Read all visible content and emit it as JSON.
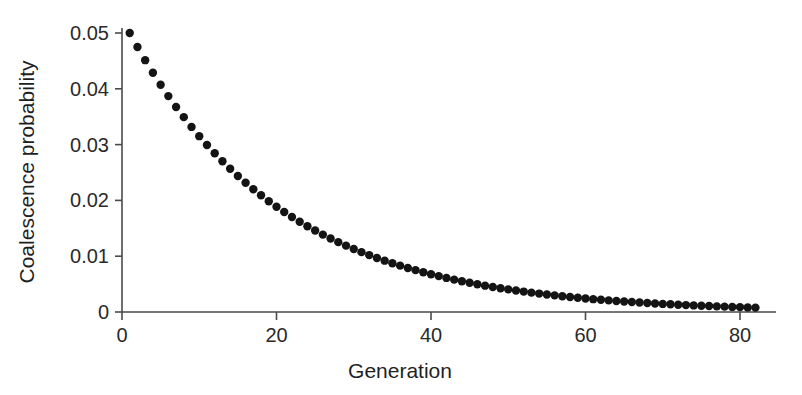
{
  "figure": {
    "background_color": "#ffffff",
    "point_color": "#141414",
    "axis_color": "#4a4a4a"
  },
  "chart_data": {
    "type": "scatter",
    "title": "",
    "subtitle": "",
    "xlabel": "Generation",
    "ylabel": "Coalescence probability",
    "xlim": [
      0,
      84
    ],
    "ylim": [
      0,
      0.052
    ],
    "xticks": [
      0,
      20,
      40,
      60,
      80
    ],
    "xticklabels": [
      "0",
      "20",
      "40",
      "60",
      "80"
    ],
    "yticks": [
      0,
      0.01,
      0.02,
      0.03,
      0.04,
      0.05
    ],
    "yticklabels": [
      "0",
      "0.01",
      "0.02",
      "0.03",
      "0.04",
      "0.05"
    ],
    "grid": false,
    "legend": null,
    "annotations": [],
    "marker": "circle",
    "marker_size": 4.2,
    "series": [
      {
        "name": "Coalescence probability",
        "x": [
          1,
          2,
          3,
          4,
          5,
          6,
          7,
          8,
          9,
          10,
          11,
          12,
          13,
          14,
          15,
          16,
          17,
          18,
          19,
          20,
          21,
          22,
          23,
          24,
          25,
          26,
          27,
          28,
          29,
          30,
          31,
          32,
          33,
          34,
          35,
          36,
          37,
          38,
          39,
          40,
          41,
          42,
          43,
          44,
          45,
          46,
          47,
          48,
          49,
          50,
          51,
          52,
          53,
          54,
          55,
          56,
          57,
          58,
          59,
          60,
          61,
          62,
          63,
          64,
          65,
          66,
          67,
          68,
          69,
          70,
          71,
          72,
          73,
          74,
          75,
          76,
          77,
          78,
          79,
          80,
          81,
          82
        ],
        "y": [
          0.05,
          0.0475,
          0.04513,
          0.04287,
          0.04073,
          0.03869,
          0.03675,
          0.03492,
          0.03317,
          0.03151,
          0.02994,
          0.02844,
          0.02702,
          0.02567,
          0.02438,
          0.02316,
          0.02201,
          0.02091,
          0.01986,
          0.01887,
          0.01792,
          0.01703,
          0.01618,
          0.01537,
          0.0146,
          0.01387,
          0.01318,
          0.01252,
          0.01189,
          0.0113,
          0.01073,
          0.0102,
          0.00969,
          0.0092,
          0.00874,
          0.00831,
          0.00789,
          0.0075,
          0.00712,
          0.00676,
          0.00643,
          0.00611,
          0.0058,
          0.00551,
          0.00523,
          0.00497,
          0.00472,
          0.00449,
          0.00426,
          0.00405,
          0.00385,
          0.00366,
          0.00347,
          0.0033,
          0.00313,
          0.00298,
          0.00283,
          0.00269,
          0.00255,
          0.00242,
          0.0023,
          0.00219,
          0.00208,
          0.00197,
          0.00188,
          0.00178,
          0.00169,
          0.00161,
          0.00153,
          0.00145,
          0.00138,
          0.00131,
          0.00124,
          0.00118,
          0.00112,
          0.00107,
          0.00101,
          0.00096,
          0.00091,
          0.00087,
          0.00082,
          0.00078
        ]
      }
    ]
  }
}
